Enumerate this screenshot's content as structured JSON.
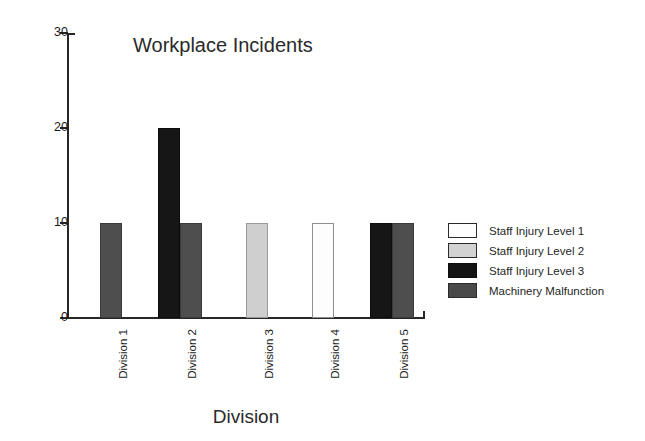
{
  "chart_data": {
    "type": "bar",
    "title": "Workplace Incidents",
    "xlabel": "Division",
    "ylabel": "",
    "categories": [
      "Division 1",
      "Division 2",
      "Division 3",
      "Division 4",
      "Division 5"
    ],
    "ylim": [
      0,
      30
    ],
    "yticks": [
      "0",
      "10",
      "20",
      "30"
    ],
    "grid": false,
    "legend_position": "right",
    "series": [
      {
        "name": "Staff Injury Level 1",
        "color": "#fdfdfd",
        "values": [
          0,
          0,
          0,
          10,
          0
        ]
      },
      {
        "name": "Staff Injury Level 2",
        "color": "#cfcfcf",
        "values": [
          0,
          0,
          10,
          0,
          0
        ]
      },
      {
        "name": "Staff Injury Level 3",
        "color": "#161616",
        "values": [
          0,
          20,
          0,
          0,
          10
        ]
      },
      {
        "name": "Machinery Malfunction",
        "color": "#4e4e4e",
        "values": [
          10,
          10,
          0,
          0,
          10
        ]
      }
    ],
    "bars": [
      {
        "category": "Division 1",
        "series": "Machinery Malfunction",
        "value": 10,
        "style": "s4",
        "left": 100,
        "width": 22
      },
      {
        "category": "Division 2",
        "series": "Staff Injury Level 3",
        "value": 20,
        "style": "s3",
        "left": 158,
        "width": 22
      },
      {
        "category": "Division 2",
        "series": "Machinery Malfunction",
        "value": 10,
        "style": "s4",
        "left": 180,
        "width": 22
      },
      {
        "category": "Division 3",
        "series": "Staff Injury Level 2",
        "value": 10,
        "style": "s2",
        "left": 246,
        "width": 22
      },
      {
        "category": "Division 4",
        "series": "Staff Injury Level 1",
        "value": 10,
        "style": "s1",
        "left": 312,
        "width": 22
      },
      {
        "category": "Division 5",
        "series": "Staff Injury Level 3",
        "value": 10,
        "style": "s3",
        "left": 370,
        "width": 22
      },
      {
        "category": "Division 5",
        "series": "Machinery Malfunction",
        "value": 10,
        "style": "s4",
        "left": 392,
        "width": 22
      }
    ]
  },
  "axis": {
    "y_ticks": [
      {
        "label": "30",
        "value": 30
      },
      {
        "label": "20",
        "value": 20
      },
      {
        "label": "10",
        "value": 10
      },
      {
        "label": "0",
        "value": 0
      }
    ]
  },
  "legend": {
    "items": [
      {
        "label": "Staff Injury Level 1",
        "style": "s1"
      },
      {
        "label": "Staff Injury Level 2",
        "style": "s2"
      },
      {
        "label": "Staff Injury Level 3",
        "style": "s3"
      },
      {
        "label": "Machinery Malfunction",
        "style": "s4"
      }
    ]
  }
}
